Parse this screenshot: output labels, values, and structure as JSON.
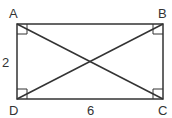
{
  "diagram": {
    "type": "rectangle-with-diagonals",
    "vertices": [
      {
        "label": "A",
        "x": 17,
        "y": 24
      },
      {
        "label": "B",
        "x": 163,
        "y": 24
      },
      {
        "label": "C",
        "x": 163,
        "y": 99
      },
      {
        "label": "D",
        "x": 17,
        "y": 99
      }
    ],
    "side_labels": {
      "left": "2",
      "bottom": "6"
    },
    "right_angle_markers": [
      "A",
      "B",
      "C",
      "D"
    ],
    "diagonals": [
      "AC",
      "BD"
    ],
    "stroke_color": "#333333"
  }
}
